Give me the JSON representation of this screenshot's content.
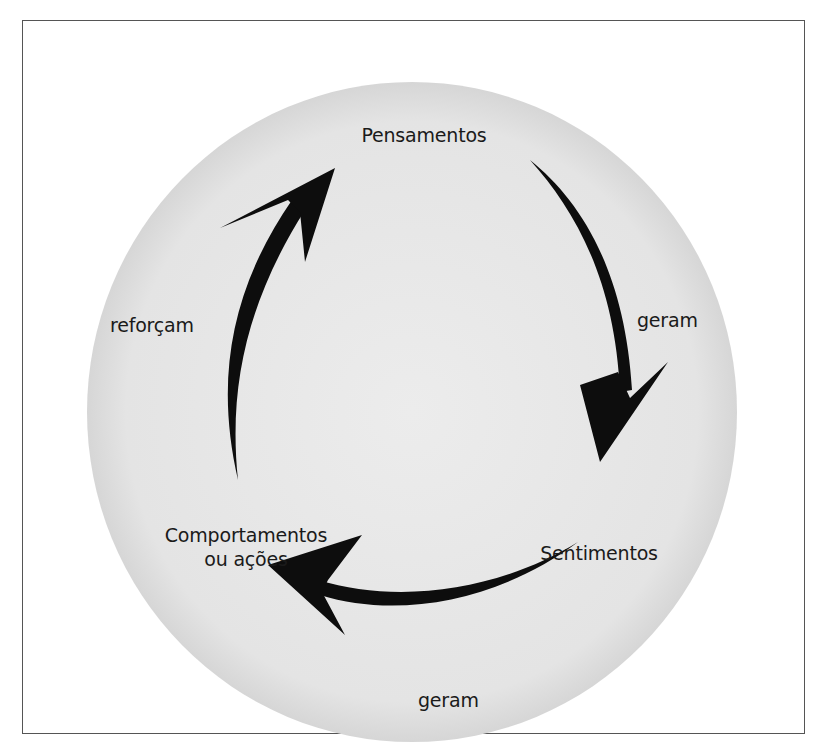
{
  "diagram": {
    "type": "cycle",
    "nodes": [
      {
        "id": "pensamentos",
        "label": "Pensamentos"
      },
      {
        "id": "sentimentos",
        "label": "Sentimentos"
      },
      {
        "id": "comportamentos",
        "label_line1": "Comportamentos",
        "label_line2": "ou ações"
      }
    ],
    "edges": [
      {
        "from": "pensamentos",
        "to": "sentimentos",
        "label": "geram"
      },
      {
        "from": "sentimentos",
        "to": "comportamentos",
        "label": "geram"
      },
      {
        "from": "comportamentos",
        "to": "pensamentos",
        "label": "reforçam"
      }
    ],
    "colors": {
      "circle_fill": "#e6e6e6",
      "arrow": "#0d0d0d",
      "text": "#1a1a1a",
      "border": "#555555"
    }
  }
}
